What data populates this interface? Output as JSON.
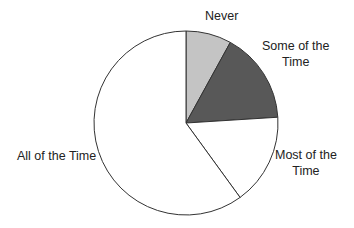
{
  "chart_data": {
    "type": "pie",
    "title": "",
    "categories": [
      "Never",
      "Some of the Time",
      "Most of the Time",
      "All of the Time"
    ],
    "values": [
      8,
      16,
      16,
      60
    ],
    "colors": [
      "#c4c4c4",
      "#585858",
      "#ffffff",
      "#ffffff"
    ],
    "start_angle": "12 o'clock",
    "direction": "clockwise",
    "legend": "none (labels placed outside slices)"
  },
  "labels": {
    "never": "Never",
    "some_line1": "Some of the",
    "some_line2": "Time",
    "most_line1": "Most of the",
    "most_line2": "Time",
    "all": "All of the Time"
  },
  "geometry": {
    "cx": 186,
    "cy": 123,
    "r": 92
  }
}
